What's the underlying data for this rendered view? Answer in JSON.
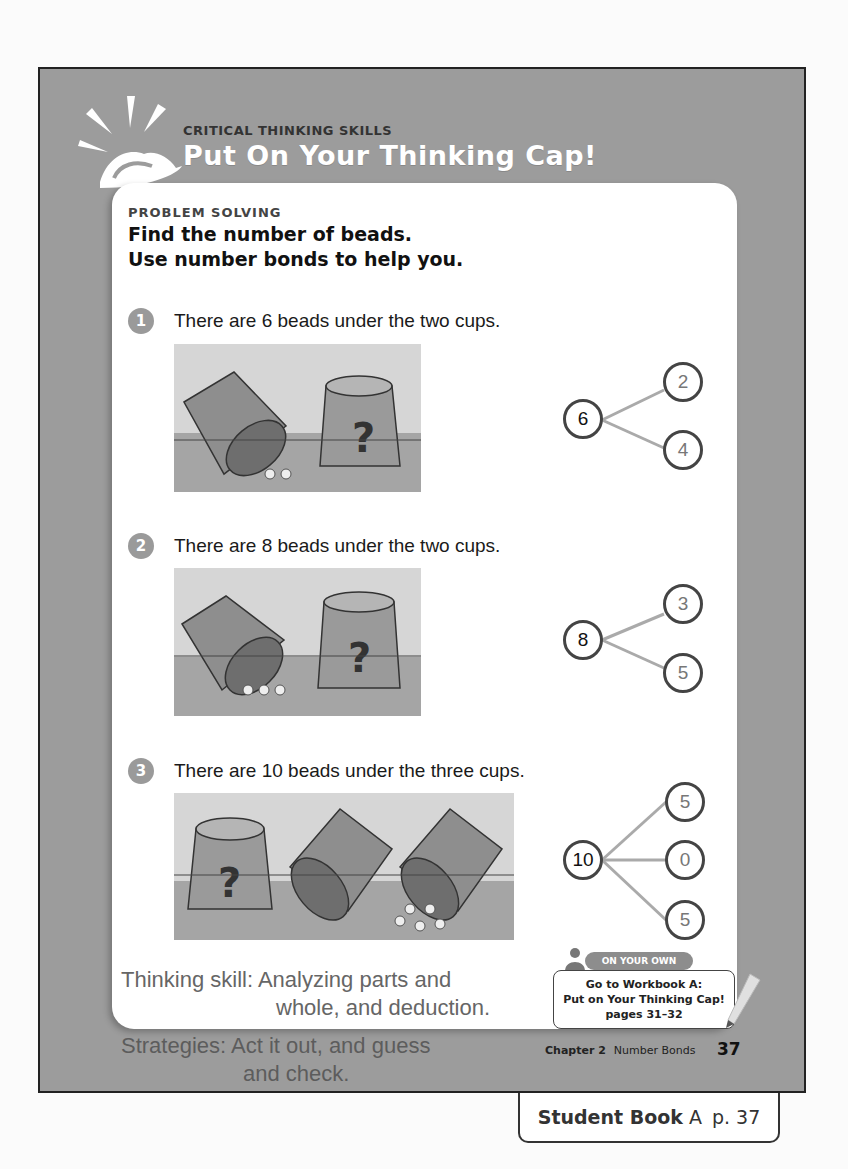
{
  "banner": {
    "kicker": "CRITICAL THINKING SKILLS",
    "title": "Put On Your Thinking Cap!",
    "icon": "thinking-cap-icon"
  },
  "section": {
    "kicker": "PROBLEM SOLVING",
    "heading_line1": "Find the number of beads.",
    "heading_line2": "Use number bonds to help you."
  },
  "questions": [
    {
      "number": "1",
      "text": "There are 6 beads under the two cups.",
      "picture": {
        "cups": 2,
        "visible_beads": 2,
        "hidden_cup_mark": "?"
      },
      "bond": {
        "whole": "6",
        "parts": [
          "2",
          "4"
        ]
      }
    },
    {
      "number": "2",
      "text": "There are 8 beads under the two cups.",
      "picture": {
        "cups": 2,
        "visible_beads": 3,
        "hidden_cup_mark": "?"
      },
      "bond": {
        "whole": "8",
        "parts": [
          "3",
          "5"
        ]
      }
    },
    {
      "number": "3",
      "text": "There are 10 beads under the three cups.",
      "picture": {
        "cups": 3,
        "visible_beads": 5,
        "hidden_cup_mark": "?"
      },
      "bond": {
        "whole": "10",
        "parts": [
          "5",
          "0",
          "5"
        ]
      }
    }
  ],
  "notes": {
    "thinking_skill_line1": "Thinking skill: Analyzing parts and",
    "thinking_skill_line2": "whole, and deduction.",
    "strategies_line1": "Strategies: Act it out, and guess",
    "strategies_line2": "and check."
  },
  "on_your_own": {
    "label": "ON YOUR OWN",
    "line1": "Go to Workbook A:",
    "line2": "Put on Your Thinking Cap!",
    "line3": "pages 31–32"
  },
  "footer": {
    "chapter": "Chapter 2",
    "chapter_title": "Number Bonds",
    "page": "37"
  },
  "tab": {
    "book": "Student Book",
    "volume": "A",
    "page": "p. 37"
  },
  "colors": {
    "frame": "#9c9c9c",
    "card": "#ffffff",
    "number_badge": "#9a9a9a",
    "bond_line": "#aaaaaa"
  }
}
